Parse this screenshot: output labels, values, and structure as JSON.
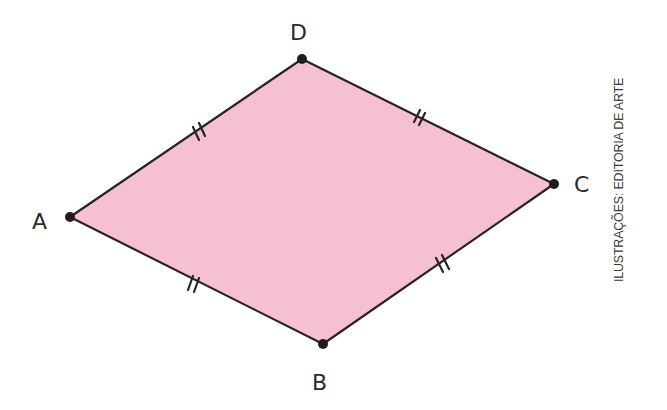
{
  "figure": {
    "shape": "rhombus",
    "fill_color": "#f4c0d2",
    "stroke_color": "#2a2228",
    "vertices": [
      {
        "label": "A",
        "x": 70,
        "y": 217
      },
      {
        "label": "B",
        "x": 323,
        "y": 344
      },
      {
        "label": "C",
        "x": 554,
        "y": 184
      },
      {
        "label": "D",
        "x": 302,
        "y": 59
      }
    ],
    "sides": [
      "AB",
      "BC",
      "CD",
      "DA"
    ],
    "congruence_marks": "double tick on every side",
    "labels": {
      "A": "A",
      "B": "B",
      "C": "C",
      "D": "D"
    }
  },
  "credit": "ILUSTRAÇÕES: EDITORIA DE ARTE"
}
